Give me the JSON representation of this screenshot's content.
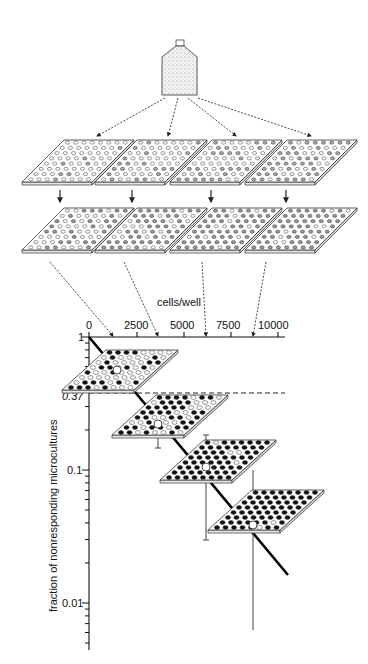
{
  "figure": {
    "type": "limiting-dilution-assay-diagram",
    "bottle": {
      "label": "cell-suspension-bottle-icon"
    },
    "row1_plates": 4,
    "row2_plates": 4,
    "plate_grid": {
      "rows": 8,
      "cols": 8
    }
  },
  "chart_data": {
    "type": "scatter",
    "title": "",
    "xlabel": "cells/well",
    "ylabel": "fraction of nonresponding microcultures",
    "x_ticks": [
      "0",
      "2500",
      "5000",
      "7500",
      "10000"
    ],
    "x_tick_values": [
      0,
      2500,
      5000,
      7500,
      10000
    ],
    "y_ticks": [
      "1",
      "0.37",
      "0.1",
      "0.01"
    ],
    "y_scale": "log",
    "ylim": [
      0.005,
      1
    ],
    "xlim": [
      0,
      10000
    ],
    "reference_line": {
      "y": 0.37,
      "style": "dashed"
    },
    "series": [
      {
        "name": "data",
        "x": [
          1500,
          3500,
          6000,
          8500
        ],
        "y": [
          0.55,
          0.25,
          0.09,
          0.035
        ],
        "error_low": [
          0.45,
          0.2,
          0.03,
          0.005
        ],
        "error_high": [
          0.65,
          0.37,
          0.18,
          0.09
        ]
      },
      {
        "name": "fit",
        "type": "line",
        "x": [
          0,
          10000
        ],
        "y": [
          1,
          0.018
        ]
      }
    ],
    "grid": false,
    "legend": "none"
  },
  "labels": {
    "xaxis_title": "cells/well",
    "yaxis_title": "fraction of nonresponding microcultures",
    "x0": "0",
    "x1": "2500",
    "x2": "5000",
    "x3": "7500",
    "x4": "10000",
    "y1": "1",
    "y037": "0.37",
    "y01": "0.1",
    "y001": "0.01"
  }
}
